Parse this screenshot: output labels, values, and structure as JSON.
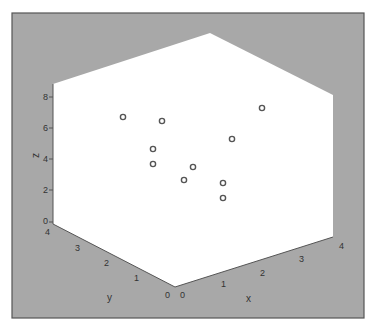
{
  "chart_data": {
    "type": "scatter",
    "subtype": "3d-scatter",
    "title": "",
    "xlabel": "x",
    "ylabel": "y",
    "zlabel": "z",
    "xlim": [
      0,
      4
    ],
    "ylim": [
      0,
      4
    ],
    "zlim": [
      0,
      8
    ],
    "x_ticks": [
      "0",
      "1",
      "2",
      "3",
      "4"
    ],
    "y_ticks": [
      "0",
      "1",
      "2",
      "3",
      "4"
    ],
    "z_ticks": [
      "0",
      "2",
      "4",
      "6",
      "8"
    ],
    "grid": false,
    "marker": "open-circle",
    "points_screen": [
      {
        "sx": 123,
        "sy": 117
      },
      {
        "sx": 162,
        "sy": 121
      },
      {
        "sx": 153,
        "sy": 149
      },
      {
        "sx": 153,
        "sy": 164
      },
      {
        "sx": 193,
        "sy": 167
      },
      {
        "sx": 184,
        "sy": 180
      },
      {
        "sx": 223,
        "sy": 183
      },
      {
        "sx": 223,
        "sy": 198
      },
      {
        "sx": 232,
        "sy": 139
      },
      {
        "sx": 262,
        "sy": 108
      }
    ],
    "point_count": 10
  },
  "colors": {
    "frame_bg": "#a8a8a8",
    "frame_border": "#555555",
    "plot_bg": "#ffffff",
    "axis_line": "#555555",
    "marker": "#555555"
  },
  "labels": {
    "x": "x",
    "y": "y",
    "z": "z"
  }
}
